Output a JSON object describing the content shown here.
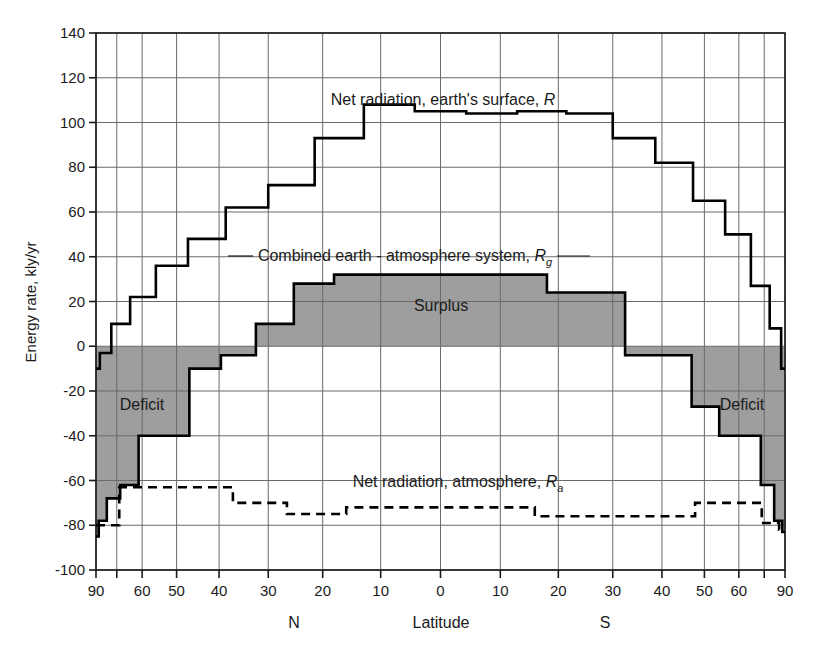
{
  "chart_data": {
    "type": "line",
    "title": "",
    "xlabel": "Latitude",
    "ylabel": "Energy rate, kly/yr",
    "ylim": [
      -100,
      140
    ],
    "yticks": [
      140,
      120,
      100,
      80,
      60,
      40,
      20,
      0,
      -20,
      -40,
      -60,
      -80,
      -100
    ],
    "ytick_labels": [
      "140",
      "120",
      "100",
      "80",
      "60",
      "40",
      "20",
      "0",
      "-20",
      "-40",
      "-60",
      "-80",
      "-100"
    ],
    "x_axis_note": "latitude, sine-scaled, 90N at left to 90S at right",
    "xticks_deg": [
      90,
      70,
      60,
      50,
      40,
      30,
      20,
      10,
      0,
      -10,
      -20,
      -30,
      -40,
      -50,
      -60,
      -70,
      -90
    ],
    "xtick_labels": [
      "90",
      "",
      "60",
      "50",
      "40",
      "30",
      "20",
      "10",
      "0",
      "10",
      "20",
      "30",
      "40",
      "50",
      "60",
      "",
      "90"
    ],
    "hemisphere_labels": [
      {
        "text": "N",
        "deg": 30
      },
      {
        "text": "S",
        "deg": -30
      }
    ],
    "grid": true,
    "legend_position": "inline-annotations",
    "band_edges_deg": [
      90,
      80,
      70,
      60,
      50,
      40,
      30,
      20,
      10,
      0,
      -10,
      -20,
      -30,
      -40,
      -50,
      -60,
      -70,
      -80,
      -90
    ],
    "series": [
      {
        "name": "Net radiation, earth's surface, R",
        "symbol": "R",
        "style": "solid-step",
        "color": "#000000",
        "values": [
          -10,
          -3,
          10,
          22,
          36,
          48,
          62,
          72,
          93,
          108,
          105,
          104,
          105,
          104,
          93,
          82,
          65,
          50,
          27,
          8,
          -10
        ]
      },
      {
        "name": "Combined earth - atmosphere system, Rg",
        "symbol": "Rg",
        "style": "solid-step",
        "color": "#000000",
        "values": [
          -85,
          -78,
          -68,
          -62,
          -40,
          -40,
          -10,
          -4,
          10,
          28,
          32,
          32,
          32,
          32,
          32,
          24,
          24,
          -4,
          -4,
          -27,
          -40,
          -40,
          -62,
          -78,
          -83
        ]
      },
      {
        "name": "Net radiation, atmosphere, Ra",
        "symbol": "Ra",
        "style": "dashed-step",
        "color": "#000000",
        "values": [
          -80,
          -80,
          -63,
          -63,
          -63,
          -70,
          -75,
          -72,
          -72,
          -72,
          -76,
          -76,
          -76,
          -70,
          -70,
          -79,
          -82
        ]
      }
    ],
    "shaded_regions": [
      {
        "label": "Surplus",
        "fill": "#9e9e9e",
        "description": "area between Rg curve and zero line where Rg > 0, tropics"
      },
      {
        "label": "Deficit",
        "fill": "#9e9e9e",
        "description": "area between Rg curve and zero line where Rg < 0, high latitudes, both hemispheres"
      }
    ],
    "annotations": [
      {
        "text": "Net radiation, earth's surface, R",
        "deg": 13,
        "value": 118
      },
      {
        "text": "Combined earth - atmosphere system, Rg",
        "deg": 6,
        "value": 42
      },
      {
        "text": "Surplus",
        "deg": 2,
        "value": 15
      },
      {
        "text": "Deficit",
        "deg": 72,
        "value": -27
      },
      {
        "text": "Deficit",
        "deg": -72,
        "value": -27
      },
      {
        "text": "Net radiation, atmosphere, Ra",
        "deg": -2,
        "value": -62
      }
    ]
  },
  "labels": {
    "y_axis_title": "Energy rate, kly/yr",
    "x_axis_title": "Latitude",
    "north": "N",
    "south": "S",
    "surplus": "Surplus",
    "deficit_left": "Deficit",
    "deficit_right": "Deficit",
    "series_r_prefix": "Net radiation, earth's surface, ",
    "series_r_symbol": "R",
    "series_rg_prefix": "Combined earth - atmosphere system, ",
    "series_rg_symbol": "R",
    "series_rg_sub": "g",
    "series_ra_prefix": "Net radiation, atmosphere, ",
    "series_ra_symbol": "R",
    "series_ra_sub": "a"
  },
  "colors": {
    "shade": "#9e9e9e",
    "grid": "#6b6b6b",
    "axis": "#1a1a1a",
    "curve": "#000000",
    "background": "#ffffff"
  }
}
